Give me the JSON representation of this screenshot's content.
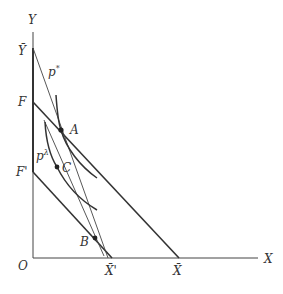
{
  "diagram": {
    "axes": {
      "y_label": "Y",
      "x_label": "X",
      "origin_label": "O"
    },
    "y_axis_labels": {
      "y_bar": "Ȳ",
      "f": "F",
      "f_prime": "F'"
    },
    "x_axis_labels": {
      "x_bar_prime": "X̄'",
      "x_bar": "X̄"
    },
    "price_lines": {
      "p_star": "p",
      "p_star_sup": "*",
      "p_lambda": "p",
      "p_lambda_sup": "λ"
    },
    "points": {
      "a": "A",
      "b": "B",
      "c": "C"
    },
    "colors": {
      "line": "#333333",
      "background": "#ffffff"
    }
  }
}
